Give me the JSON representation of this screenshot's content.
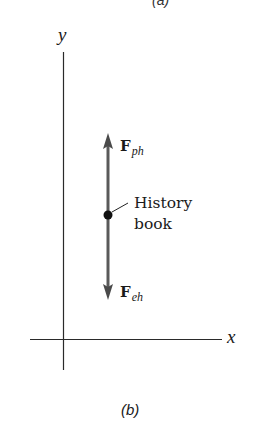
{
  "figure": {
    "top_caption_partial": "(a)",
    "caption": "(b)",
    "axes": {
      "x_label": "x",
      "y_label": "y",
      "origin_px": [
        63,
        339
      ],
      "x_axis_px": {
        "from": 30,
        "to": 222
      },
      "y_axis_px": {
        "from": 52,
        "to": 370
      }
    },
    "object": {
      "name": "History book",
      "label_line1": "History",
      "label_line2": "book",
      "dot_px": [
        108,
        215
      ]
    },
    "forces": [
      {
        "symbol": "F",
        "subscript": "ph",
        "direction": "up",
        "tip_px": [
          108,
          134
        ],
        "color": "#5a5a5a"
      },
      {
        "symbol": "F",
        "subscript": "eh",
        "direction": "down",
        "tip_px": [
          108,
          299
        ],
        "color": "#5a5a5a"
      }
    ],
    "colors": {
      "axis": "#2a2a2a",
      "arrow": "#5a5a5a",
      "dot": "#111111",
      "text": "#1a1a1a"
    }
  }
}
